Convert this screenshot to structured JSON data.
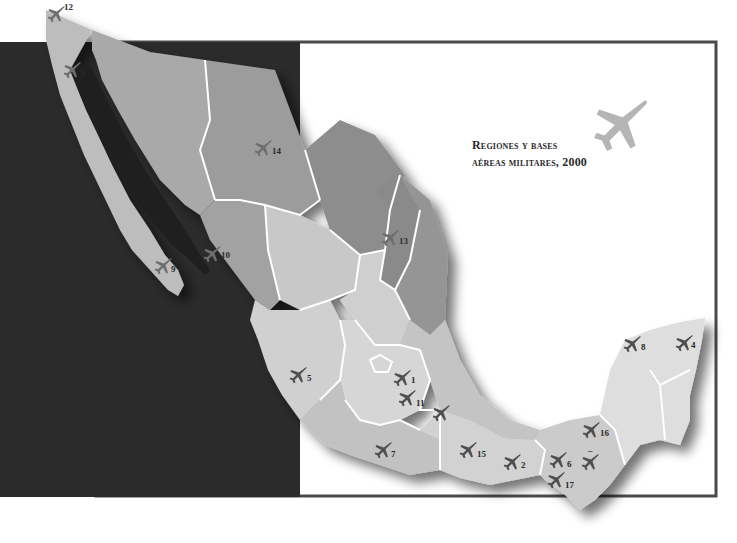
{
  "map": {
    "title_line1": "Regiones y bases",
    "title_line2": "aéreas militares, 2000",
    "colors": {
      "ocean": "#2b2b2b",
      "region_dark": "#8d8d8d",
      "region_mid": "#a9a9a9",
      "region_light": "#c8c8c8",
      "region_pale": "#dcdcdc",
      "border": "#ffffff",
      "frame": "#4a4a4a",
      "plane_dark": "#4f4f4f",
      "plane_mid": "#6e6e6e",
      "legend_plane": "#b5b5b5"
    },
    "bases": [
      {
        "label": "12",
        "tone": "mid"
      },
      {
        "label": "3",
        "tone": "mid"
      },
      {
        "label": "14",
        "tone": "mid"
      },
      {
        "label": "10",
        "tone": "mid"
      },
      {
        "label": "9",
        "tone": "mid"
      },
      {
        "label": "13",
        "tone": "mid"
      },
      {
        "label": "8",
        "tone": "dark"
      },
      {
        "label": "4",
        "tone": "dark"
      },
      {
        "label": "5",
        "tone": "dark"
      },
      {
        "label": "1",
        "tone": "dark"
      },
      {
        "label": "11",
        "tone": "dark"
      },
      {
        "label": "",
        "tone": "dark"
      },
      {
        "label": "7",
        "tone": "dark"
      },
      {
        "label": "15",
        "tone": "dark"
      },
      {
        "label": "2",
        "tone": "dark"
      },
      {
        "label": "16",
        "tone": "dark"
      },
      {
        "label": "6",
        "tone": "dark"
      },
      {
        "label": "–",
        "tone": "dark"
      },
      {
        "label": "17",
        "tone": "dark"
      }
    ]
  }
}
